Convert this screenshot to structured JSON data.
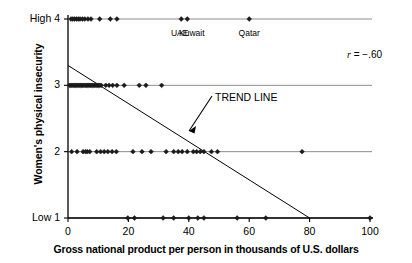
{
  "chart_data": {
    "type": "scatter",
    "title": "",
    "xlabel": "Gross national product per person in thousands of U.S. dollars",
    "ylabel": "Women's physical insecurity",
    "xlim": [
      0,
      100
    ],
    "ylim": [
      1,
      4
    ],
    "xticks": [
      0,
      20,
      40,
      60,
      80,
      100
    ],
    "xtick_labels": [
      "0",
      "20",
      "40",
      "60",
      "80",
      "100"
    ],
    "yticks": [
      1,
      2,
      3,
      4
    ],
    "ytick_labels": [
      "Low 1",
      "2",
      "3",
      "High 4"
    ],
    "grid": false,
    "gridlines_horizontal": [
      1,
      2,
      3,
      4
    ],
    "legend": "none",
    "correlation": "r = −.60",
    "trend_line": {
      "label": "TREND LINE",
      "x_start": 0,
      "y_start": 3.3,
      "x_end": 80,
      "y_end": 1.0
    },
    "annotations": [
      {
        "text": "UAE",
        "x": 37,
        "y": 4
      },
      {
        "text": "Kuwait",
        "x": 41,
        "y": 4
      },
      {
        "text": "Qatar",
        "x": 60,
        "y": 4
      }
    ],
    "series": [
      {
        "name": "Countries",
        "points": [
          [
            1.0,
            4
          ],
          [
            1.6,
            4
          ],
          [
            2.2,
            4
          ],
          [
            2.8,
            4
          ],
          [
            3.4,
            4
          ],
          [
            4.0,
            4
          ],
          [
            4.8,
            4
          ],
          [
            5.6,
            4
          ],
          [
            6.6,
            4
          ],
          [
            7.6,
            4
          ],
          [
            10.5,
            4
          ],
          [
            14.0,
            4
          ],
          [
            16.2,
            4
          ],
          [
            37.5,
            4
          ],
          [
            39.5,
            4
          ],
          [
            60.0,
            4
          ],
          [
            0.5,
            3
          ],
          [
            0.9,
            3
          ],
          [
            1.3,
            3
          ],
          [
            1.7,
            3
          ],
          [
            2.1,
            3
          ],
          [
            2.5,
            3
          ],
          [
            2.9,
            3
          ],
          [
            3.3,
            3
          ],
          [
            3.7,
            3
          ],
          [
            4.1,
            3
          ],
          [
            4.5,
            3
          ],
          [
            4.9,
            3
          ],
          [
            5.3,
            3
          ],
          [
            5.7,
            3
          ],
          [
            6.1,
            3
          ],
          [
            6.5,
            3
          ],
          [
            6.9,
            3
          ],
          [
            7.3,
            3
          ],
          [
            7.7,
            3
          ],
          [
            8.1,
            3
          ],
          [
            8.5,
            3
          ],
          [
            8.9,
            3
          ],
          [
            9.3,
            3
          ],
          [
            9.7,
            3
          ],
          [
            10.1,
            3
          ],
          [
            10.5,
            3
          ],
          [
            11.0,
            3
          ],
          [
            12.5,
            3
          ],
          [
            13.6,
            3
          ],
          [
            14.8,
            3
          ],
          [
            16.2,
            3
          ],
          [
            18.6,
            3
          ],
          [
            23.6,
            3
          ],
          [
            25.8,
            3
          ],
          [
            31.0,
            3
          ],
          [
            1.2,
            2
          ],
          [
            3.0,
            2
          ],
          [
            5.0,
            2
          ],
          [
            5.8,
            2
          ],
          [
            6.4,
            2
          ],
          [
            7.2,
            2
          ],
          [
            9.5,
            2
          ],
          [
            10.8,
            2
          ],
          [
            12.0,
            2
          ],
          [
            13.2,
            2
          ],
          [
            14.6,
            2
          ],
          [
            16.0,
            2
          ],
          [
            21.5,
            2
          ],
          [
            24.5,
            2
          ],
          [
            27.5,
            2
          ],
          [
            32.5,
            2
          ],
          [
            35.0,
            2
          ],
          [
            36.5,
            2
          ],
          [
            37.8,
            2
          ],
          [
            39.5,
            2
          ],
          [
            41.5,
            2
          ],
          [
            42.6,
            2
          ],
          [
            43.8,
            2
          ],
          [
            45.0,
            2
          ],
          [
            47.5,
            2
          ],
          [
            49.5,
            2
          ],
          [
            77.5,
            2
          ],
          [
            19.8,
            1
          ],
          [
            22.0,
            1
          ],
          [
            31.5,
            1
          ],
          [
            35.0,
            1
          ],
          [
            40.0,
            1
          ],
          [
            43.0,
            1
          ],
          [
            45.0,
            1
          ],
          [
            56.0,
            1
          ],
          [
            65.5,
            1
          ],
          [
            100.0,
            1
          ]
        ]
      }
    ]
  },
  "style": {
    "axis_color": "#000000",
    "gridline_color": "#6e6e6e",
    "point_color": "#1a1a1a",
    "trend_color": "#000000",
    "background": "#ffffff"
  }
}
